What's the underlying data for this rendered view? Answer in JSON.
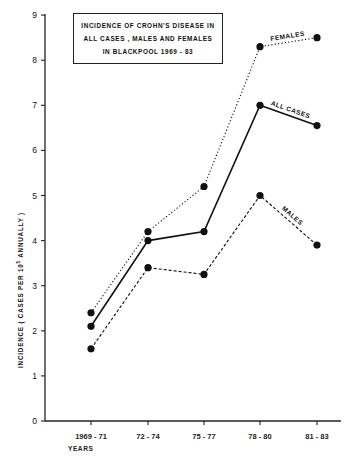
{
  "chart_data": {
    "type": "line",
    "title_lines": [
      "INCIDENCE OF CROHN'S DISEASE IN",
      "ALL CASES , MALES AND FEMALES",
      "IN BLACKPOOL  1969 - 83"
    ],
    "xlabel": "YEARS",
    "ylabel_parts": {
      "pre": "INCIDENCE  ( CASES  PER  10",
      "sup": "5",
      "post": " ANNUALLY )"
    },
    "ylabel": "INCIDENCE ( CASES PER 10^5 ANNUALLY )",
    "categories": [
      "1969 - 71",
      "72 - 74",
      "75 - 77",
      "78 - 80",
      "81 - 83"
    ],
    "yticks": [
      0,
      1,
      2,
      3,
      4,
      5,
      6,
      7,
      8,
      9
    ],
    "ylim": [
      0,
      9
    ],
    "grid": false,
    "legend": "inline labels on lines",
    "series": [
      {
        "name": "FEMALES",
        "style": "dotted",
        "values": [
          2.4,
          4.2,
          5.2,
          8.3,
          8.5
        ]
      },
      {
        "name": "ALL CASES",
        "style": "solid",
        "values": [
          2.1,
          4.0,
          4.2,
          7.0,
          6.55
        ]
      },
      {
        "name": "MALES",
        "style": "dashed",
        "values": [
          1.6,
          3.4,
          3.25,
          5.0,
          3.9
        ]
      }
    ]
  }
}
